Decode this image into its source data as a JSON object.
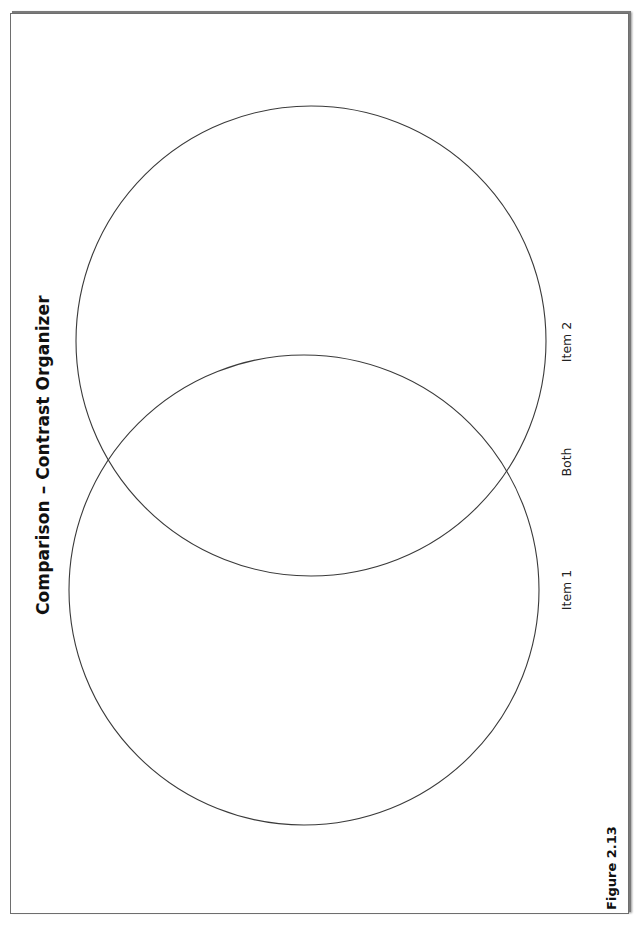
{
  "diagram": {
    "title": "Comparison – Contrast Organizer",
    "type": "venn",
    "circles": [
      {
        "name": "Item 2",
        "cx": 311,
        "cy": 341,
        "r": 235
      },
      {
        "name": "Item 1",
        "cx": 304,
        "cy": 590,
        "r": 235
      }
    ],
    "labels": {
      "item2": "Item 2",
      "both": "Both",
      "item1": "Item 1"
    },
    "figure_caption": "Figure 2.13",
    "stroke_color": "#3a3a3a",
    "frame_color": "#6e6e6e"
  }
}
